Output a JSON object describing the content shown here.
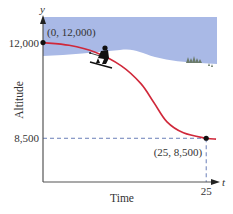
{
  "chart_data": {
    "type": "line",
    "title": "",
    "xlabel": "Time",
    "ylabel": "Altitude",
    "x_axis_var": "t",
    "y_axis_var": "y",
    "y_ticks": [
      {
        "value": 12000,
        "label": "12,000"
      },
      {
        "value": 8500,
        "label": "8,500"
      }
    ],
    "x_ticks": [
      {
        "value": 25,
        "label": "25"
      }
    ],
    "xlim": [
      0,
      26.5
    ],
    "ylim": [
      6900,
      12900
    ],
    "series": [
      {
        "name": "altitude",
        "color": "#d0283a",
        "points": [
          {
            "t": 0,
            "y": 12000
          },
          {
            "t": 4,
            "y": 11900
          },
          {
            "t": 8,
            "y": 11650
          },
          {
            "t": 12,
            "y": 11150
          },
          {
            "t": 15,
            "y": 10500
          },
          {
            "t": 17,
            "y": 9800
          },
          {
            "t": 19,
            "y": 9100
          },
          {
            "t": 21.5,
            "y": 8700
          },
          {
            "t": 25,
            "y": 8500
          },
          {
            "t": 26.5,
            "y": 8470
          }
        ]
      }
    ],
    "annotations": [
      {
        "t": 0,
        "y": 12000,
        "label": "(0, 12,000)"
      },
      {
        "t": 25,
        "y": 8500,
        "label": "(25, 8,500)"
      }
    ],
    "reference_lines": [
      {
        "kind": "horizontal",
        "value": 8500,
        "style": "dashed",
        "color": "#6a7fb8"
      },
      {
        "kind": "vertical",
        "value": 25,
        "style": "dashed",
        "color": "#6a7fb8"
      }
    ],
    "grid": false,
    "background_scene": {
      "sky_color": "#a9b9e6",
      "snow_color": "#ffffff",
      "elements": [
        "skier",
        "snow-hills",
        "pine-trees"
      ]
    }
  }
}
